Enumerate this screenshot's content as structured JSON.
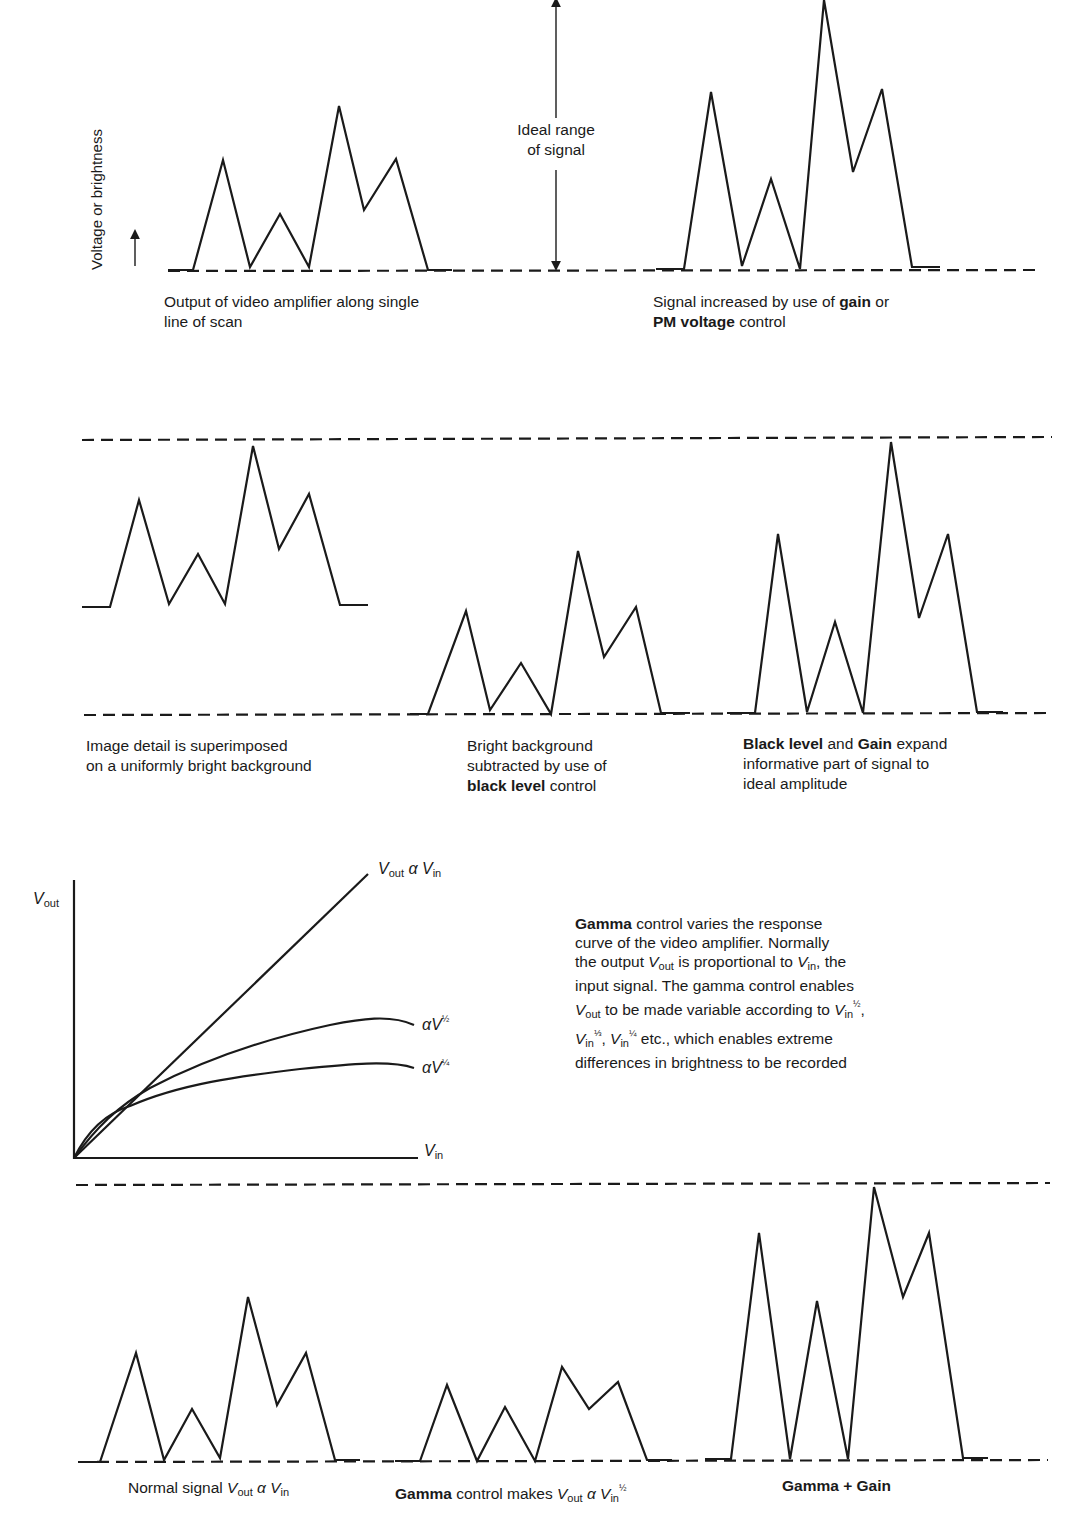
{
  "figure": {
    "y_axis_label": "Voltage or brightness",
    "ideal_range_label_line1": "Ideal range",
    "ideal_range_label_line2": "of signal",
    "stroke_color": "#1a1a1a",
    "background": "#ffffff"
  },
  "panels": {
    "p1": {
      "caption_line1": "Output of video amplifier along single",
      "caption_line2": "line of scan",
      "points": "168,270 193,270 223,160 250,267 280,214 309,267 339,106 364,210 396,159 428,270 452,270"
    },
    "p2": {
      "caption_line1_pre": "Signal increased by use of ",
      "caption_line1_bold": "gain",
      "caption_line1_post": " or",
      "caption_line2_bold": "PM voltage",
      "caption_line2_post": " control",
      "points": "656,269 684,269 711,92 742,266 771,179 800,269 824,0 853,172 882,89 912,267 940,267"
    },
    "p3": {
      "caption_line1": "Image detail is superimposed",
      "caption_line2": "on a uniformly bright background",
      "points": "82,607 110,607 139,500 169,604 198,554 225,604 253,446 279,549 309,494 340,605 368,605"
    },
    "p4": {
      "caption_line1": "Bright background",
      "caption_line2": "subtracted by use of",
      "caption_line3_bold": "black level",
      "caption_line3_post": " control",
      "points": "410,714 428,714 466,611 490,710 521,663 551,714 578,551 604,657 636,607 661,713 690,713"
    },
    "p5": {
      "caption_line1_bold1": "Black level",
      "caption_line1_mid": " and ",
      "caption_line1_bold2": "Gain",
      "caption_line1_post": " expand",
      "caption_line2": "informative part of signal to",
      "caption_line3": "ideal amplitude",
      "points": "727,713 755,713 778,534 807,712 835,622 863,713 891,442 919,618 948,534 977,712 1003,712"
    },
    "p6": {
      "caption_pre": "Normal signal ",
      "caption_v1": "V",
      "caption_v1_sub": "out",
      "caption_alpha": " α ",
      "caption_v2": "V",
      "caption_v2_sub": "in",
      "points": "80,1462 100,1462 136,1353 164,1460 192,1409 220,1458 248,1297 277,1405 306,1353 335,1460 360,1460"
    },
    "p7": {
      "caption_bold": "Gamma",
      "caption_mid": " control makes ",
      "caption_v1": "V",
      "caption_v1_sub": "out",
      "caption_alpha": " α ",
      "caption_v2": "V",
      "caption_v2_sub": "in",
      "caption_exp": "½",
      "points": "395,1461 420,1461 447,1385 477,1461 505,1407 535,1461 562,1367 589,1409 618,1382 647,1460 672,1460"
    },
    "p8": {
      "caption": "Gamma + Gain",
      "points": "705,1459 731,1459 759,1233 790,1459 817,1301 848,1459 874,1187 903,1297 929,1233 963,1458 988,1458"
    }
  },
  "gamma_graph": {
    "y_axis_label": "V",
    "y_axis_label_sub": "out",
    "x_axis_label": "V",
    "x_axis_label_sub": "in",
    "line_label_v1": "V",
    "line_label_v1_sub": "out",
    "line_label_alpha": " α ",
    "line_label_v2": "V",
    "line_label_v2_sub": "in",
    "curve_half_label": "αV",
    "curve_half_exp": "½",
    "curve_quarter_label": "αV",
    "curve_quarter_exp": "¼",
    "linear_path": "M74,1158 L368,874",
    "half_path": "M74,1158 C96,1128 118,1106 150,1088 C200,1062 260,1040 330,1025 C360,1019 390,1014 414,1025",
    "quarter_path": "M74,1158 C90,1126 110,1112 130,1106 C180,1084 240,1076 300,1069 C350,1064 390,1060 414,1068"
  },
  "gamma_text": {
    "l1_bold": "Gamma",
    "l1_post": " control varies the response",
    "l2": "curve of the video amplifier. Normally",
    "l3_pre": "the output ",
    "l3_v": "V",
    "l3_v_sub": "out",
    "l3_mid": " is proportional to ",
    "l3_v2": "V",
    "l3_v2_sub": "in",
    "l3_post": ", the",
    "l4": "input signal. The gamma control enables",
    "l5_v": "V",
    "l5_v_sub": "out",
    "l5_mid": " to be made variable according to ",
    "l5_v2": "V",
    "l5_v2_sub": "in",
    "l5_exp": "½",
    "l5_post": ",",
    "l6_v1": "V",
    "l6_v1_sub": "in",
    "l6_exp1": "⅓",
    "l6_sep": ", ",
    "l6_v2": "V",
    "l6_v2_sub": "in",
    "l6_exp2": "¼",
    "l6_post": " etc., which enables extreme",
    "l7": "differences in brightness to be recorded"
  }
}
